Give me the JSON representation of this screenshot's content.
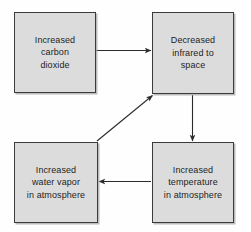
{
  "diagram": {
    "type": "flowchart",
    "box_fill_color": "#dcdcdc",
    "box_border_color": "#3b3b3b",
    "arrow_color": "#2b2b2b",
    "background_color": "#fefefe",
    "nodes": [
      {
        "id": "co2",
        "label": "Increased\ncarbon\ndioxide",
        "position": "top-left"
      },
      {
        "id": "infrared",
        "label": "Decreased\ninfrared to\nspace",
        "position": "top-right"
      },
      {
        "id": "vapor",
        "label": "Increased\nwater vapor\nin atmosphere",
        "position": "bottom-left"
      },
      {
        "id": "temp",
        "label": "Increased\ntemperature\nin atmosphere",
        "position": "bottom-right"
      }
    ],
    "edges": [
      {
        "id": "co2-to-infrared",
        "from": "co2",
        "to": "infrared",
        "direction": "right",
        "style": "straight"
      },
      {
        "id": "infrared-to-temp",
        "from": "infrared",
        "to": "temp",
        "direction": "down",
        "style": "straight"
      },
      {
        "id": "temp-to-vapor",
        "from": "temp",
        "to": "vapor",
        "direction": "left",
        "style": "straight"
      },
      {
        "id": "vapor-to-infrared",
        "from": "vapor",
        "to": "infrared",
        "direction": "up-right",
        "style": "diagonal"
      }
    ]
  }
}
